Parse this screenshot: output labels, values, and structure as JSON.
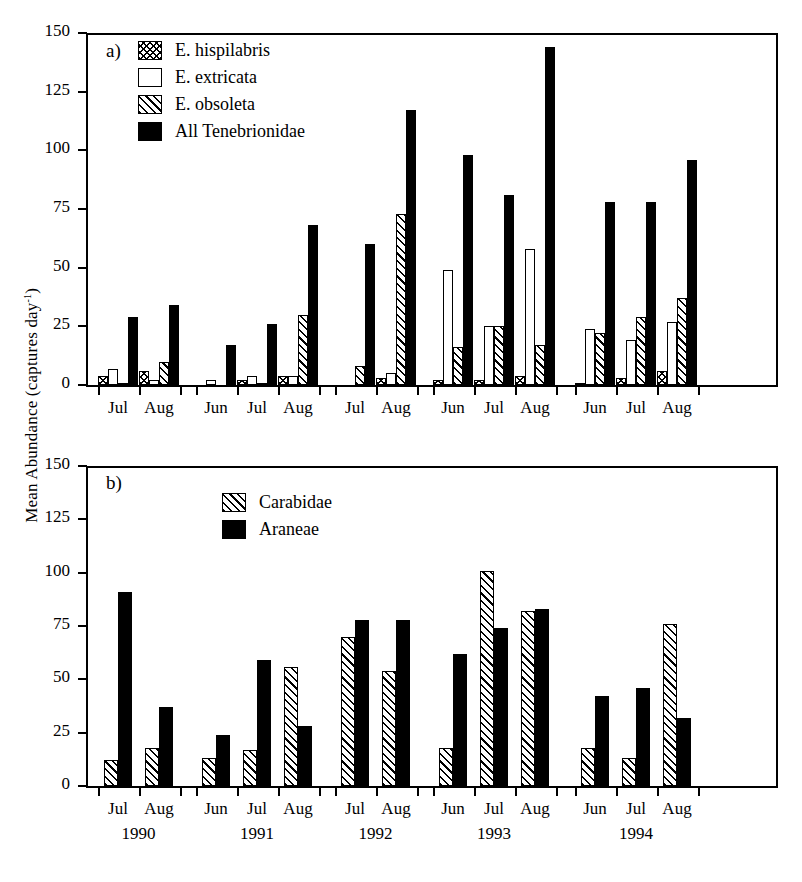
{
  "axis": {
    "ylabel_main": "Mean Abundance (captures day",
    "ylabel_sup": "-1",
    "ylabel_close": ")",
    "yticks": [
      "0",
      "25",
      "50",
      "75",
      "100",
      "125",
      "150"
    ]
  },
  "panel_a": {
    "tag": "a)",
    "legend": [
      {
        "label": "E. hispilabris",
        "pattern": "cross"
      },
      {
        "label": "E. extricata",
        "pattern": "open"
      },
      {
        "label": "E. obsoleta",
        "pattern": "diag"
      },
      {
        "label": "All Tenebrionidae",
        "pattern": "solid"
      }
    ],
    "months": [
      "Jul",
      "Aug",
      "Jun",
      "Jul",
      "Aug",
      "Jul",
      "Aug",
      "Jun",
      "Jul",
      "Aug",
      "Jun",
      "Jul",
      "Aug"
    ]
  },
  "panel_b": {
    "tag": "b)",
    "legend": [
      {
        "label": "Carabidae",
        "pattern": "diag"
      },
      {
        "label": "Araneae",
        "pattern": "solid"
      }
    ],
    "months": [
      "Jul",
      "Aug",
      "Jun",
      "Jul",
      "Aug",
      "Jul",
      "Aug",
      "Jun",
      "Jul",
      "Aug",
      "Jun",
      "Jul",
      "Aug"
    ],
    "years": [
      "1990",
      "1991",
      "1992",
      "1993",
      "1994"
    ]
  },
  "chart_data": [
    {
      "type": "bar",
      "panel": "a",
      "title": "a)",
      "xlabel": "",
      "ylabel": "Mean Abundance (captures day^-1)",
      "ylim": [
        0,
        150
      ],
      "yticks": [
        0,
        25,
        50,
        75,
        100,
        125,
        150
      ],
      "grid": false,
      "legend_position": "top-left-inside",
      "categories": [
        "1990 Jul",
        "1990 Aug",
        "1991 Jun",
        "1991 Jul",
        "1991 Aug",
        "1992 Jul",
        "1992 Aug",
        "1993 Jun",
        "1993 Jul",
        "1993 Aug",
        "1994 Jun",
        "1994 Jul",
        "1994 Aug"
      ],
      "series": [
        {
          "name": "E. hispilabris",
          "pattern": "cross",
          "values": [
            4,
            6,
            0,
            2,
            4,
            0,
            3,
            2,
            2,
            4,
            1,
            3,
            6
          ]
        },
        {
          "name": "E. extricata",
          "pattern": "open",
          "values": [
            7,
            2,
            2,
            4,
            4,
            0,
            5,
            49,
            25,
            58,
            24,
            19,
            27
          ]
        },
        {
          "name": "E. obsoleta",
          "pattern": "diag",
          "values": [
            1,
            10,
            0,
            1,
            30,
            8,
            73,
            16,
            25,
            17,
            22,
            29,
            37
          ]
        },
        {
          "name": "All Tenebrionidae",
          "pattern": "solid",
          "values": [
            29,
            34,
            17,
            26,
            68,
            60,
            117,
            98,
            81,
            144,
            78,
            78,
            96
          ]
        }
      ]
    },
    {
      "type": "bar",
      "panel": "b",
      "title": "b)",
      "xlabel": "",
      "ylabel": "Mean Abundance (captures day^-1)",
      "ylim": [
        0,
        150
      ],
      "yticks": [
        0,
        25,
        50,
        75,
        100,
        125,
        150
      ],
      "grid": false,
      "legend_position": "top-center-inside",
      "categories": [
        "1990 Jul",
        "1990 Aug",
        "1991 Jun",
        "1991 Jul",
        "1991 Aug",
        "1992 Jul",
        "1992 Aug",
        "1993 Jun",
        "1993 Jul",
        "1993 Aug",
        "1994 Jun",
        "1994 Jul",
        "1994 Aug"
      ],
      "series": [
        {
          "name": "Carabidae",
          "pattern": "diag",
          "values": [
            12,
            18,
            13,
            17,
            56,
            70,
            54,
            18,
            101,
            82,
            18,
            13,
            76
          ]
        },
        {
          "name": "Araneae",
          "pattern": "solid",
          "values": [
            91,
            37,
            24,
            59,
            28,
            78,
            78,
            62,
            74,
            83,
            42,
            46,
            32
          ]
        }
      ]
    }
  ]
}
